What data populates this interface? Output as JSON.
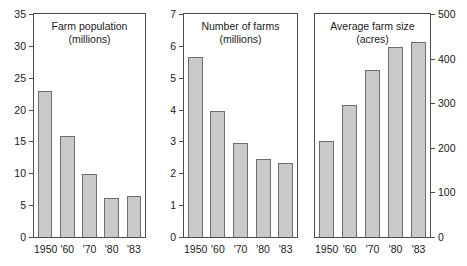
{
  "figure": {
    "background": "#ffffff",
    "bar_fill": "#c9c9c9",
    "bar_stroke": "#6e6e6e",
    "axis_color": "#4d4d4d"
  },
  "chart_data": [
    {
      "type": "bar",
      "title": "Farm population",
      "subtitle": "(millions)",
      "xlabel": "",
      "ylabel": "",
      "ylim": [
        0,
        35
      ],
      "yticks": [
        0,
        5,
        10,
        15,
        20,
        25,
        30,
        35
      ],
      "ytick_labels": [
        "0",
        "5",
        "10",
        "15",
        "20",
        "25",
        "30",
        "35"
      ],
      "y_axis_side": "left",
      "grid": false,
      "legend": "none",
      "categories": [
        "1950",
        "'60",
        "'70",
        "'80",
        "'83"
      ],
      "values": [
        22.9,
        15.8,
        9.9,
        6.1,
        6.4
      ]
    },
    {
      "type": "bar",
      "title": "Number of farms",
      "subtitle": "(millions)",
      "xlabel": "",
      "ylabel": "",
      "ylim": [
        0,
        7
      ],
      "yticks": [
        0,
        1,
        2,
        3,
        4,
        5,
        6,
        7
      ],
      "ytick_labels": [
        "0",
        "1",
        "2",
        "3",
        "4",
        "5",
        "6",
        "7"
      ],
      "y_axis_side": "left",
      "grid": false,
      "legend": "none",
      "categories": [
        "1950",
        "'60",
        "'70",
        "'80",
        "'83"
      ],
      "values": [
        5.65,
        3.97,
        2.95,
        2.44,
        2.33
      ]
    },
    {
      "type": "bar",
      "title": "Average farm size",
      "subtitle": "(acres)",
      "xlabel": "",
      "ylabel": "",
      "ylim": [
        0,
        500
      ],
      "yticks": [
        0,
        100,
        200,
        300,
        400,
        500
      ],
      "ytick_labels": [
        "0",
        "100",
        "200",
        "300",
        "400",
        "500"
      ],
      "y_axis_side": "right",
      "grid": false,
      "legend": "none",
      "categories": [
        "1950",
        "'60",
        "'70",
        "'80",
        "'83"
      ],
      "values": [
        216,
        297,
        374,
        427,
        437
      ]
    }
  ]
}
